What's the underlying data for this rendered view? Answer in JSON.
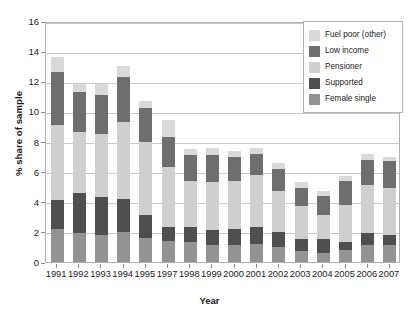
{
  "chart_data": {
    "type": "bar",
    "title": "",
    "xlabel": "Year",
    "ylabel": "% share of sample",
    "ylim": [
      0,
      16
    ],
    "ytick_step": 2,
    "yticks": [
      0,
      2,
      4,
      6,
      8,
      10,
      12,
      14,
      16
    ],
    "grid": true,
    "stacked": true,
    "legend_position": "top-right",
    "categories": [
      "1991",
      "1992",
      "1993",
      "1994",
      "1995",
      "1997",
      "1998",
      "1999",
      "2000",
      "2001",
      "2002",
      "2003",
      "2004",
      "2005",
      "2006",
      "2007"
    ],
    "series": [
      {
        "name": "Female single",
        "color": "#939393",
        "values": [
          2.2,
          1.9,
          1.8,
          2.0,
          1.6,
          1.4,
          1.3,
          1.1,
          1.1,
          1.2,
          1.0,
          0.7,
          0.6,
          0.8,
          1.1,
          1.1
        ]
      },
      {
        "name": "Supported",
        "color": "#4f4f4f",
        "values": [
          1.9,
          2.7,
          2.5,
          2.2,
          1.5,
          0.9,
          1.0,
          1.0,
          1.1,
          1.1,
          1.0,
          0.8,
          0.9,
          0.5,
          0.8,
          0.7
        ]
      },
      {
        "name": "Pensioner",
        "color": "#cfcfcf",
        "values": [
          5.0,
          4.0,
          4.2,
          5.1,
          4.9,
          4.0,
          3.1,
          3.2,
          3.2,
          3.5,
          2.7,
          2.2,
          1.6,
          2.5,
          3.2,
          3.1
        ]
      },
      {
        "name": "Low income",
        "color": "#6e6e6e",
        "values": [
          3.5,
          2.7,
          2.6,
          3.0,
          2.2,
          2.0,
          1.7,
          1.8,
          1.6,
          1.4,
          1.5,
          1.2,
          1.3,
          1.6,
          1.7,
          1.8
        ]
      },
      {
        "name": "Fuel poor (other)",
        "color": "#d9d9d9",
        "values": [
          1.0,
          0.5,
          0.7,
          0.7,
          0.5,
          1.1,
          0.4,
          0.5,
          0.4,
          0.4,
          0.4,
          0.4,
          0.3,
          0.3,
          0.4,
          0.3
        ]
      }
    ]
  },
  "legend": {
    "items": [
      {
        "label": "Fuel poor (other)",
        "color": "#d9d9d9"
      },
      {
        "label": "Low income",
        "color": "#6e6e6e"
      },
      {
        "label": "Pensioner",
        "color": "#cfcfcf"
      },
      {
        "label": "Supported",
        "color": "#4f4f4f"
      },
      {
        "label": "Female single",
        "color": "#939393"
      }
    ]
  },
  "axes": {
    "x_title": "Year",
    "y_title": "% share of sample"
  }
}
